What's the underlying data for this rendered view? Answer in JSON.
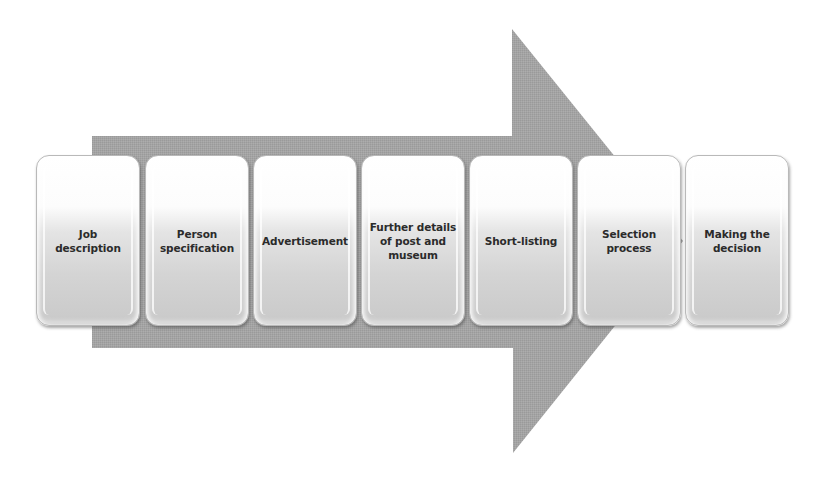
{
  "diagram": {
    "type": "process-arrow",
    "arrow": {
      "color": "#a3a3a3",
      "direction": "right"
    },
    "steps": [
      {
        "label": "Job\ndescription"
      },
      {
        "label": "Person\nspecification"
      },
      {
        "label": "Advertisement"
      },
      {
        "label": "Further details\nof post and\nmuseum"
      },
      {
        "label": "Short-listing"
      },
      {
        "label": "Selection\nprocess"
      },
      {
        "label": "Making the\ndecision"
      }
    ]
  }
}
